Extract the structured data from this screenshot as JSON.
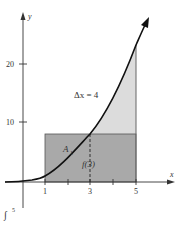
{
  "figure": {
    "axes": {
      "x_label": "x",
      "y_label": "y",
      "x_ticks": [
        {
          "value": 1,
          "label": "1"
        },
        {
          "value": 2,
          "label": ""
        },
        {
          "value": 3,
          "label": "3"
        },
        {
          "value": 4,
          "label": ""
        },
        {
          "value": 5,
          "label": "5"
        }
      ],
      "y_ticks": [
        {
          "value": 10,
          "label": "10"
        },
        {
          "value": 20,
          "label": "20"
        }
      ]
    },
    "curve": "y = x^2",
    "rectangle": {
      "x_from": 1,
      "x_to": 5,
      "height_label": "f(3)",
      "height": 9
    },
    "annotations": {
      "delta_x": "Δx = 4",
      "area_label": "A",
      "area_subscript": "1",
      "f3_label": "f(3)",
      "bottom_fragment_integral": "∫",
      "bottom_fragment_limit": "5"
    },
    "colors": {
      "rect_fill": "#a9a9a9",
      "region_light": "#dcdcdc",
      "curve": "#111111",
      "axis": "#333333"
    }
  }
}
